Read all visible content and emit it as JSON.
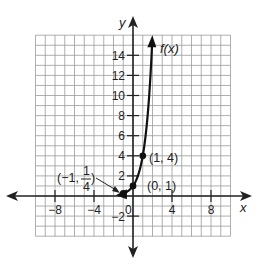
{
  "chart_data": {
    "type": "line",
    "title": "",
    "xlabel": "x",
    "ylabel": "y",
    "function_label": "f(x)",
    "function": "4^x",
    "xlim": [
      -10,
      10
    ],
    "ylim": [
      -4,
      16
    ],
    "grid": true,
    "x_ticks": [
      {
        "value": -8,
        "label": "−8"
      },
      {
        "value": -4,
        "label": "−4"
      },
      {
        "value": 4,
        "label": "4"
      },
      {
        "value": 8,
        "label": "8"
      }
    ],
    "y_ticks": [
      {
        "value": 14,
        "label": "14"
      },
      {
        "value": 12,
        "label": "12"
      },
      {
        "value": 10,
        "label": "10"
      },
      {
        "value": 8,
        "label": "8"
      },
      {
        "value": 6,
        "label": "6"
      },
      {
        "value": 4,
        "label": "4"
      },
      {
        "value": 2,
        "label": "2"
      },
      {
        "value": -2,
        "label": "−2"
      }
    ],
    "origin_label": "0",
    "points": [
      {
        "x": -1,
        "y": 0.25,
        "label": "(−1, 1/4)",
        "label_main": "(−1,",
        "label_num": "1",
        "label_den": "4",
        "label_close": ")"
      },
      {
        "x": 0,
        "y": 1,
        "label": "(0, 1)"
      },
      {
        "x": 1,
        "y": 4,
        "label": "(1, 4)"
      }
    ],
    "curve": {
      "x_start": -1.25,
      "x_end": 1.95,
      "end_arrow": true,
      "start_arrow": true
    }
  },
  "colors": {
    "grid": "#9a9a9a",
    "axis": "#222222",
    "curve": "#111111"
  }
}
